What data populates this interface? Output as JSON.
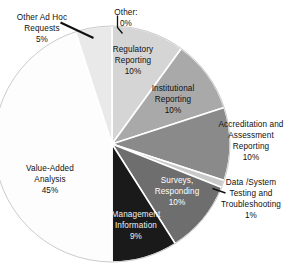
{
  "chart_data": {
    "type": "pie",
    "title": "",
    "subtitle": "",
    "xlabel": "",
    "ylabel": "",
    "legend_position": "none",
    "grid": false,
    "start_angle_deg": 0,
    "direction": "clockwise",
    "units": "percent",
    "categories": [
      "Other:",
      "Regulatory Reporting",
      "Institutional Reporting",
      "Accreditation and Assessment Reporting",
      "Data /System Testing and Troubleshooting",
      "Surveys, Responding",
      "Management Information",
      "Value-Added Analysis",
      "Other Ad Hoc Requests"
    ],
    "values": [
      0,
      10,
      10,
      10,
      1,
      10,
      9,
      45,
      5
    ],
    "colors": [
      "#ffffff",
      "#d5d5d5",
      "#a9a9a9",
      "#8a8a8a",
      "#c9c9c9",
      "#6e6e6e",
      "#1a1a1a",
      "#fdfdfd",
      "#e9e9e9"
    ]
  },
  "slices": [
    {
      "name": "other",
      "label_lines": [
        "Other:",
        "0%"
      ],
      "label_text": "Other: 0%",
      "value": 0,
      "value_label": "0%",
      "color": "#ffffff",
      "placement": "outside",
      "text_color": "dark",
      "leader": true
    },
    {
      "name": "regulatory-reporting",
      "label_lines": [
        "Regulatory",
        "Reporting",
        "10%"
      ],
      "label_text": "Regulatory Reporting 10%",
      "value": 10,
      "value_label": "10%",
      "color": "#d5d5d5",
      "placement": "inside",
      "text_color": "dark",
      "leader": false
    },
    {
      "name": "institutional-reporting",
      "label_lines": [
        "Institutional",
        "Reporting",
        "10%"
      ],
      "label_text": "Institutional Reporting 10%",
      "value": 10,
      "value_label": "10%",
      "color": "#a9a9a9",
      "placement": "inside",
      "text_color": "dark",
      "leader": false
    },
    {
      "name": "accreditation-assessment-reporting",
      "label_lines": [
        "Accreditation and",
        "Assessment",
        "Reporting",
        "10%"
      ],
      "label_text": "Accreditation and Assessment Reporting 10%",
      "value": 10,
      "value_label": "10%",
      "color": "#8a8a8a",
      "placement": "outside",
      "text_color": "dark",
      "leader": false
    },
    {
      "name": "data-system-testing-troubleshooting",
      "label_lines": [
        "Data /System",
        "Testing and",
        "Troubleshooting",
        "1%"
      ],
      "label_text": "Data /System Testing and Troubleshooting 1%",
      "value": 1,
      "value_label": "1%",
      "color": "#c9c9c9",
      "placement": "outside",
      "text_color": "dark",
      "leader": true
    },
    {
      "name": "surveys-responding",
      "label_lines": [
        "Surveys,",
        "Responding",
        "10%"
      ],
      "label_text": "Surveys, Responding 10%",
      "value": 10,
      "value_label": "10%",
      "color": "#6e6e6e",
      "placement": "inside",
      "text_color": "white",
      "leader": false
    },
    {
      "name": "management-information",
      "label_lines": [
        "Management",
        "Information",
        "9%"
      ],
      "label_text": "Management Information 9%",
      "value": 9,
      "value_label": "9%",
      "color": "#1a1a1a",
      "placement": "inside",
      "text_color": "white",
      "leader": false
    },
    {
      "name": "value-added-analysis",
      "label_lines": [
        "Value-Added",
        "Analysis",
        "45%"
      ],
      "label_text": "Value-Added Analysis 45%",
      "value": 45,
      "value_label": "45%",
      "color": "#fdfdfd",
      "placement": "inside",
      "text_color": "dark",
      "leader": false
    },
    {
      "name": "other-ad-hoc-requests",
      "label_lines": [
        "Other Ad Hoc",
        "Requests",
        "5%"
      ],
      "label_text": "Other Ad Hoc Requests 5%",
      "value": 5,
      "value_label": "5%",
      "color": "#e9e9e9",
      "placement": "outside",
      "text_color": "dark",
      "leader": true
    }
  ]
}
